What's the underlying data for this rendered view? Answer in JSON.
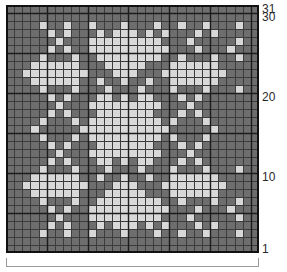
{
  "chart_data": {
    "type": "heatmap",
    "title": "",
    "xlabel": "",
    "ylabel": "",
    "columns": 31,
    "rows": 31,
    "legend": [
      {
        "key": 0,
        "name": "background-dark",
        "color": "#6e6e6e"
      },
      {
        "key": 1,
        "name": "motif-light",
        "color": "#d8d8d8"
      }
    ],
    "grid_line_color": "#1c1c1c",
    "minor_grid_line_color": "#3c3c3c",
    "heavy_line_every": 5,
    "x": [
      1,
      2,
      3,
      4,
      5,
      6,
      7,
      8,
      9,
      10,
      11,
      12,
      13,
      14,
      15,
      16,
      17,
      18,
      19,
      20,
      21,
      22,
      23,
      24,
      25,
      26,
      27,
      28,
      29,
      30,
      31
    ],
    "y": [
      31,
      30,
      29,
      28,
      27,
      26,
      25,
      24,
      23,
      22,
      21,
      20,
      19,
      18,
      17,
      16,
      15,
      14,
      13,
      12,
      11,
      10,
      9,
      8,
      7,
      6,
      5,
      4,
      3,
      2,
      1
    ],
    "values": [
      [
        0,
        0,
        0,
        0,
        0,
        0,
        0,
        0,
        0,
        0,
        0,
        0,
        0,
        0,
        0,
        0,
        0,
        0,
        0,
        0,
        0,
        0,
        0,
        0,
        0,
        0,
        0,
        0,
        0,
        0,
        0
      ],
      [
        0,
        0,
        0,
        0,
        0,
        0,
        0,
        0,
        0,
        0,
        0,
        0,
        0,
        0,
        0,
        0,
        0,
        0,
        0,
        0,
        0,
        0,
        0,
        0,
        0,
        0,
        0,
        0,
        0,
        0,
        0
      ],
      [
        0,
        0,
        0,
        0,
        1,
        0,
        0,
        1,
        0,
        0,
        1,
        0,
        0,
        0,
        1,
        0,
        0,
        0,
        1,
        0,
        0,
        1,
        0,
        0,
        1,
        0,
        0,
        0,
        1,
        0,
        0
      ],
      [
        0,
        0,
        0,
        0,
        0,
        1,
        0,
        1,
        0,
        0,
        0,
        1,
        0,
        1,
        1,
        1,
        0,
        1,
        0,
        1,
        0,
        0,
        0,
        1,
        0,
        1,
        0,
        0,
        0,
        0,
        0
      ],
      [
        0,
        0,
        0,
        0,
        0,
        0,
        1,
        0,
        0,
        0,
        1,
        1,
        1,
        1,
        1,
        1,
        1,
        1,
        1,
        0,
        0,
        0,
        1,
        0,
        0,
        0,
        0,
        0,
        1,
        0,
        0
      ],
      [
        0,
        0,
        0,
        0,
        0,
        1,
        0,
        1,
        0,
        0,
        1,
        1,
        1,
        1,
        1,
        1,
        1,
        1,
        1,
        1,
        0,
        0,
        0,
        1,
        0,
        0,
        0,
        1,
        0,
        0,
        0
      ],
      [
        0,
        0,
        0,
        0,
        1,
        0,
        0,
        0,
        1,
        0,
        0,
        1,
        1,
        1,
        1,
        1,
        1,
        1,
        1,
        0,
        0,
        1,
        0,
        0,
        0,
        1,
        0,
        0,
        1,
        0,
        0
      ],
      [
        0,
        0,
        0,
        1,
        1,
        1,
        1,
        1,
        1,
        0,
        0,
        0,
        1,
        1,
        1,
        1,
        1,
        0,
        0,
        0,
        1,
        1,
        1,
        1,
        1,
        1,
        0,
        0,
        0,
        0,
        0
      ],
      [
        0,
        0,
        1,
        1,
        1,
        1,
        1,
        1,
        1,
        1,
        0,
        0,
        0,
        1,
        1,
        1,
        0,
        0,
        0,
        1,
        1,
        1,
        1,
        1,
        1,
        1,
        1,
        0,
        0,
        0,
        0
      ],
      [
        0,
        0,
        0,
        1,
        1,
        1,
        1,
        1,
        1,
        0,
        0,
        1,
        0,
        0,
        1,
        0,
        0,
        1,
        0,
        0,
        1,
        1,
        1,
        1,
        1,
        1,
        0,
        0,
        0,
        0,
        0
      ],
      [
        0,
        0,
        0,
        0,
        1,
        0,
        0,
        0,
        1,
        0,
        0,
        0,
        1,
        0,
        0,
        0,
        1,
        0,
        0,
        0,
        1,
        0,
        0,
        0,
        1,
        0,
        0,
        0,
        1,
        0,
        0
      ],
      [
        0,
        0,
        0,
        0,
        0,
        1,
        0,
        1,
        0,
        0,
        0,
        1,
        1,
        0,
        1,
        0,
        1,
        1,
        0,
        0,
        0,
        1,
        0,
        1,
        0,
        0,
        0,
        0,
        0,
        0,
        0
      ],
      [
        0,
        0,
        0,
        0,
        0,
        0,
        1,
        0,
        0,
        0,
        1,
        1,
        1,
        1,
        1,
        1,
        1,
        1,
        1,
        0,
        0,
        0,
        1,
        0,
        0,
        0,
        0,
        0,
        0,
        0,
        0
      ],
      [
        0,
        0,
        0,
        0,
        0,
        1,
        0,
        1,
        0,
        0,
        0,
        1,
        1,
        1,
        1,
        1,
        1,
        1,
        0,
        0,
        0,
        1,
        0,
        1,
        0,
        0,
        0,
        0,
        0,
        0,
        0
      ],
      [
        0,
        0,
        0,
        0,
        1,
        0,
        0,
        0,
        1,
        0,
        1,
        1,
        1,
        1,
        1,
        1,
        1,
        1,
        1,
        0,
        1,
        0,
        0,
        0,
        1,
        0,
        0,
        0,
        0,
        0,
        0
      ],
      [
        0,
        0,
        0,
        1,
        0,
        0,
        0,
        0,
        0,
        1,
        1,
        1,
        1,
        1,
        1,
        1,
        1,
        1,
        1,
        1,
        0,
        0,
        0,
        0,
        0,
        1,
        0,
        0,
        0,
        0,
        0
      ],
      [
        0,
        0,
        0,
        0,
        1,
        0,
        0,
        0,
        1,
        0,
        1,
        1,
        1,
        1,
        1,
        1,
        1,
        1,
        1,
        0,
        1,
        0,
        0,
        0,
        1,
        0,
        0,
        0,
        0,
        0,
        0
      ],
      [
        0,
        0,
        0,
        0,
        0,
        1,
        0,
        1,
        0,
        0,
        0,
        1,
        1,
        1,
        1,
        1,
        1,
        1,
        0,
        0,
        0,
        1,
        0,
        1,
        0,
        0,
        0,
        0,
        0,
        0,
        0
      ],
      [
        0,
        0,
        0,
        0,
        0,
        0,
        1,
        0,
        0,
        0,
        1,
        1,
        1,
        1,
        1,
        1,
        1,
        1,
        1,
        0,
        0,
        0,
        1,
        0,
        0,
        0,
        0,
        0,
        0,
        0,
        0
      ],
      [
        0,
        0,
        0,
        0,
        0,
        1,
        0,
        1,
        0,
        0,
        0,
        1,
        1,
        0,
        1,
        0,
        1,
        1,
        0,
        0,
        0,
        1,
        0,
        1,
        0,
        0,
        0,
        0,
        0,
        0,
        0
      ],
      [
        0,
        0,
        0,
        0,
        1,
        0,
        0,
        0,
        1,
        0,
        0,
        0,
        1,
        0,
        0,
        0,
        1,
        0,
        0,
        0,
        1,
        0,
        0,
        0,
        1,
        0,
        0,
        0,
        1,
        0,
        0
      ],
      [
        0,
        0,
        0,
        1,
        1,
        1,
        1,
        1,
        1,
        0,
        0,
        1,
        0,
        0,
        1,
        0,
        0,
        1,
        0,
        0,
        1,
        1,
        1,
        1,
        1,
        1,
        0,
        0,
        0,
        0,
        0
      ],
      [
        0,
        0,
        1,
        1,
        1,
        1,
        1,
        1,
        1,
        1,
        0,
        0,
        0,
        1,
        1,
        1,
        0,
        0,
        0,
        1,
        1,
        1,
        1,
        1,
        1,
        1,
        1,
        0,
        0,
        0,
        0
      ],
      [
        0,
        0,
        0,
        1,
        1,
        1,
        1,
        1,
        1,
        0,
        0,
        0,
        1,
        1,
        1,
        1,
        1,
        0,
        0,
        0,
        1,
        1,
        1,
        1,
        1,
        1,
        0,
        0,
        0,
        0,
        0
      ],
      [
        0,
        0,
        0,
        0,
        1,
        0,
        0,
        0,
        1,
        0,
        0,
        1,
        1,
        1,
        1,
        1,
        1,
        1,
        1,
        0,
        0,
        1,
        0,
        0,
        0,
        1,
        0,
        0,
        1,
        0,
        0
      ],
      [
        0,
        0,
        0,
        0,
        0,
        1,
        0,
        1,
        0,
        0,
        1,
        1,
        1,
        1,
        1,
        1,
        1,
        1,
        1,
        1,
        0,
        0,
        0,
        1,
        0,
        0,
        0,
        1,
        0,
        0,
        0
      ],
      [
        0,
        0,
        0,
        0,
        0,
        0,
        1,
        0,
        0,
        0,
        1,
        1,
        1,
        1,
        1,
        1,
        1,
        1,
        1,
        0,
        0,
        0,
        1,
        0,
        0,
        0,
        0,
        0,
        1,
        0,
        0
      ],
      [
        0,
        0,
        0,
        0,
        0,
        1,
        0,
        1,
        0,
        0,
        0,
        1,
        0,
        1,
        1,
        1,
        0,
        1,
        0,
        1,
        0,
        0,
        0,
        1,
        0,
        1,
        0,
        0,
        0,
        0,
        0
      ],
      [
        0,
        0,
        0,
        0,
        1,
        0,
        0,
        1,
        0,
        0,
        1,
        0,
        0,
        0,
        1,
        0,
        0,
        0,
        1,
        0,
        0,
        1,
        0,
        0,
        1,
        0,
        0,
        0,
        1,
        0,
        0
      ],
      [
        0,
        0,
        0,
        0,
        0,
        0,
        0,
        0,
        0,
        0,
        0,
        0,
        0,
        0,
        0,
        0,
        0,
        0,
        0,
        0,
        0,
        0,
        0,
        0,
        0,
        0,
        0,
        0,
        0,
        0,
        0
      ],
      [
        0,
        0,
        0,
        0,
        0,
        0,
        0,
        0,
        0,
        0,
        0,
        0,
        0,
        0,
        0,
        0,
        0,
        0,
        0,
        0,
        0,
        0,
        0,
        0,
        0,
        0,
        0,
        0,
        0,
        0,
        0
      ]
    ]
  },
  "axis": {
    "row_labels": [
      {
        "text": "31",
        "row": 31
      },
      {
        "text": "30",
        "row": 30
      },
      {
        "text": "20",
        "row": 20
      },
      {
        "text": "10",
        "row": 10
      },
      {
        "text": "1",
        "row": 1
      }
    ]
  },
  "scale_bar": {
    "label": ""
  }
}
